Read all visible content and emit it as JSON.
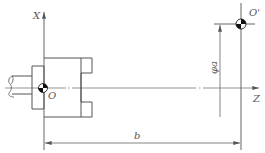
{
  "diagram": {
    "type": "lathe-workpiece-coordinate-setup",
    "labels": {
      "x_axis": "X",
      "z_axis": "Z",
      "origin": "O",
      "origin_prime": "O'",
      "diameter_dim": "φa",
      "length_dim": "b"
    },
    "colors": {
      "line": "#555555",
      "background": "#ffffff",
      "symbol_fill": "#111111"
    }
  }
}
